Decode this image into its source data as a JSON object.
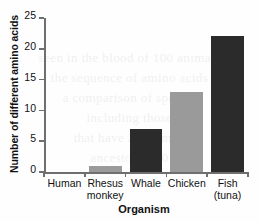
{
  "chart_data": {
    "type": "bar",
    "title": "",
    "xlabel": "Organism",
    "ylabel": "Number of different amino acids",
    "categories": [
      "Human",
      "Rhesus monkey",
      "Whale",
      "Chicken",
      "Fish (tuna)"
    ],
    "category_lines": [
      [
        "Human"
      ],
      [
        "Rhesus",
        "monkey"
      ],
      [
        "Whale"
      ],
      [
        "Chicken"
      ],
      [
        "Fish",
        "(tuna)"
      ]
    ],
    "values": [
      0,
      1,
      7,
      13,
      22
    ],
    "bar_colors": [
      "#2b2b2b",
      "#9a9a9a",
      "#2b2b2b",
      "#9a9a9a",
      "#2b2b2b"
    ],
    "ylim": [
      0,
      25
    ],
    "yticks": [
      0,
      5,
      10,
      15,
      20,
      25
    ],
    "ytick_labels": [
      "0",
      "5",
      "10",
      "15",
      "20",
      "25"
    ],
    "grid": false,
    "legend": null,
    "axis_color": "#6f6f6f"
  },
  "background_bleed": [
    "",
    "",
    "",
    "",
    "",
    "",
    ""
  ]
}
